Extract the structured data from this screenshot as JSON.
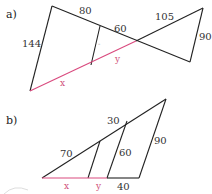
{
  "figure_a": {
    "part_label": "a)",
    "labels": {
      "left": "144",
      "top": "80",
      "middle": "60",
      "upper_right": "105",
      "right": "90",
      "x": "x",
      "y": "y",
      "tick": "-"
    },
    "colors": {
      "edge": "#222222",
      "highlight": "#d94a7e"
    }
  },
  "figure_b": {
    "part_label": "b)",
    "labels": {
      "hyp": "70",
      "hyp_upper": "30",
      "inner": "60",
      "right": "90",
      "bottom": "40",
      "x": "x",
      "y": "y"
    },
    "colors": {
      "edge": "#222222",
      "highlight": "#d94a7e"
    }
  }
}
